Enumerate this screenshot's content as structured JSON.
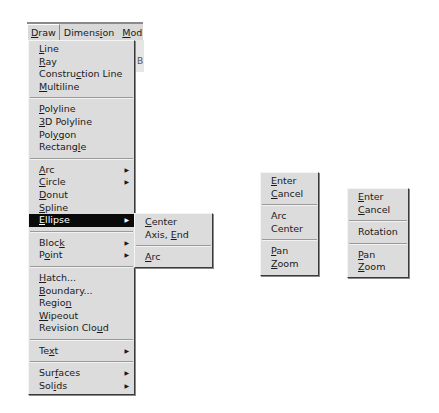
{
  "menubar": {
    "items": [
      {
        "label": "Draw",
        "mnemonic_index": 0,
        "active": true
      },
      {
        "label": "Dimension",
        "mnemonic_index": 6
      },
      {
        "label": "Modi",
        "mnemonic_index": 0
      }
    ]
  },
  "draw_menu": {
    "groups": [
      [
        {
          "label": "Line",
          "u": 0
        },
        {
          "label": "Ray",
          "u": 0
        },
        {
          "label": "Construction Line",
          "u": 7
        },
        {
          "label": "Multiline",
          "u": 0
        }
      ],
      [
        {
          "label": "Polyline",
          "u": 0
        },
        {
          "label": "3D Polyline",
          "u": 0
        },
        {
          "label": "Polygon",
          "u": 3
        },
        {
          "label": "Rectangle",
          "u": 7
        }
      ],
      [
        {
          "label": "Arc",
          "u": 0,
          "submenu": true
        },
        {
          "label": "Circle",
          "u": 0,
          "submenu": true
        },
        {
          "label": "Donut",
          "u": 0
        },
        {
          "label": "Spline",
          "u": 0
        },
        {
          "label": "Ellipse",
          "u": 0,
          "submenu": true,
          "highlighted": true
        }
      ],
      [
        {
          "label": "Block",
          "u": 4,
          "submenu": true
        },
        {
          "label": "Point",
          "u": 1,
          "submenu": true
        }
      ],
      [
        {
          "label": "Hatch...",
          "u": 0
        },
        {
          "label": "Boundary...",
          "u": 0
        },
        {
          "label": "Region",
          "u": 5
        },
        {
          "label": "Wipeout",
          "u": 0
        },
        {
          "label": "Revision Cloud",
          "u": 12
        }
      ],
      [
        {
          "label": "Text",
          "u": 2,
          "submenu": true
        }
      ],
      [
        {
          "label": "Surfaces",
          "u": 3,
          "submenu": true
        },
        {
          "label": "Solids",
          "u": 3,
          "submenu": true
        }
      ]
    ]
  },
  "ellipse_submenu": {
    "groups": [
      [
        {
          "label": "Center",
          "u": 0
        },
        {
          "label": "Axis, End",
          "u": 6
        }
      ],
      [
        {
          "label": "Arc",
          "u": 0
        }
      ]
    ]
  },
  "context_menu_1": {
    "groups": [
      [
        {
          "label": "Enter",
          "u": 0
        },
        {
          "label": "Cancel",
          "u": 0
        }
      ],
      [
        {
          "label": "Arc",
          "u": -1
        },
        {
          "label": "Center",
          "u": -1
        }
      ],
      [
        {
          "label": "Pan",
          "u": 0
        },
        {
          "label": "Zoom",
          "u": 0
        }
      ]
    ]
  },
  "context_menu_2": {
    "groups": [
      [
        {
          "label": "Enter",
          "u": 0
        },
        {
          "label": "Cancel",
          "u": 0
        }
      ],
      [
        {
          "label": "Rotation",
          "u": -1
        }
      ],
      [
        {
          "label": "Pan",
          "u": 0
        },
        {
          "label": "Zoom",
          "u": 0
        }
      ]
    ]
  },
  "background": {
    "glyph": "B"
  },
  "icons": {
    "submenu_arrow": "▶"
  }
}
